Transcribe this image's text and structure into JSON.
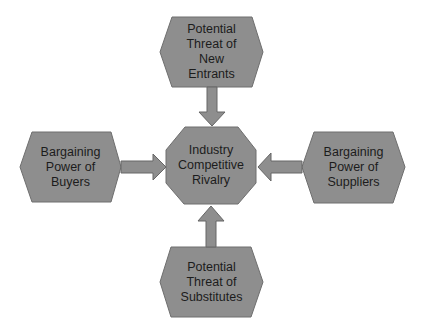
{
  "diagram": {
    "colors": {
      "shape_fill": "#8e8e8e",
      "shape_stroke": "#6e6e6e",
      "arrow_fill": "#8e8e8e",
      "text": "#1c1c1c",
      "background": "#ffffff"
    },
    "center": {
      "label": "Industry\nCompetitive\nRivalry",
      "shape": "octagon"
    },
    "top": {
      "label": "Potential\nThreat of\nNew\nEntrants",
      "shape": "hexagon"
    },
    "left": {
      "label": "Bargaining\nPower of\nBuyers",
      "shape": "hexagon"
    },
    "right": {
      "label": "Bargaining\nPower of\nSuppliers",
      "shape": "hexagon"
    },
    "bottom": {
      "label": "Potential\nThreat of\nSubstitutes",
      "shape": "hexagon"
    },
    "arrows": [
      {
        "from": "top",
        "to": "center",
        "direction": "down"
      },
      {
        "from": "left",
        "to": "center",
        "direction": "right"
      },
      {
        "from": "right",
        "to": "center",
        "direction": "left"
      },
      {
        "from": "bottom",
        "to": "center",
        "direction": "up"
      }
    ]
  }
}
